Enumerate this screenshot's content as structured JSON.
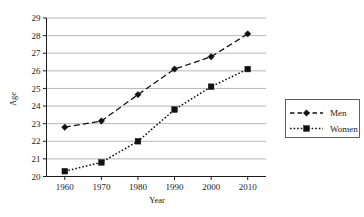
{
  "chart_data": {
    "type": "line",
    "title": "",
    "xlabel": "Year",
    "ylabel": "Age",
    "categories": [
      1960,
      1970,
      1980,
      1990,
      2000,
      2010
    ],
    "x": [
      1960,
      1970,
      1980,
      1990,
      2000,
      2010
    ],
    "xtick_labels": [
      "1960",
      "1970",
      "1980",
      "1990",
      "2000",
      "2010"
    ],
    "ytick_labels": [
      "20",
      "21",
      "22",
      "23",
      "24",
      "25",
      "26",
      "27",
      "28",
      "29"
    ],
    "ylim": [
      20,
      29
    ],
    "xlim": [
      1955,
      2015
    ],
    "grid": true,
    "legend_position": "right",
    "series": [
      {
        "name": "Men",
        "marker": "diamond",
        "line_style": "dashed",
        "color": "#111111",
        "values": [
          22.8,
          23.15,
          24.65,
          26.1,
          26.8,
          28.1
        ]
      },
      {
        "name": "Women",
        "marker": "square",
        "line_style": "dotted",
        "color": "#111111",
        "values": [
          20.3,
          20.8,
          22.0,
          23.8,
          25.1,
          26.1
        ]
      }
    ]
  },
  "legend": {
    "items": [
      {
        "label": "Men"
      },
      {
        "label": "Women"
      }
    ]
  },
  "axes": {
    "x_title": "Year",
    "y_title": "Age"
  }
}
